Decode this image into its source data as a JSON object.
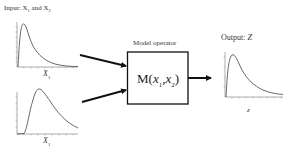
{
  "diagram": {
    "input_title": "Input: X",
    "input_title_sub1": "1",
    "input_title_and": " and X",
    "input_title_sub2": "2",
    "input1_axis_label": "X",
    "input1_axis_sub": "1",
    "input2_axis_label": "X",
    "input2_axis_sub": "1",
    "operator_title": "Model operator",
    "operator_text_prefix": "M(",
    "operator_arg1": "x",
    "operator_arg1_sub": "1",
    "operator_sep": ",",
    "operator_arg2": "x",
    "operator_arg2_sub": "2",
    "operator_text_suffix": ")",
    "output_title": "Output: ",
    "output_var": "Z",
    "output_axis_label": "z",
    "colors": {
      "line": "#111111",
      "curve": "#444444",
      "axis": "#777777"
    }
  }
}
